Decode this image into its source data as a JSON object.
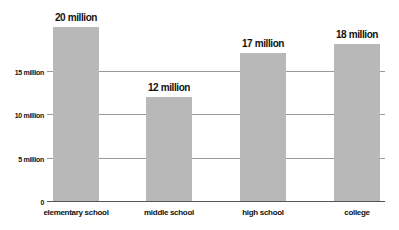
{
  "chart_data": {
    "type": "bar",
    "title": "",
    "xlabel": "",
    "ylabel": "",
    "categories": [
      "elementary school",
      "middle school",
      "high school",
      "college"
    ],
    "values": [
      20,
      12,
      17,
      18
    ],
    "unit": "million",
    "value_labels": [
      "20 million",
      "12 million",
      "17 million",
      "18 million"
    ],
    "ylim": [
      0,
      20
    ],
    "yticks": [
      0,
      5,
      10,
      15
    ],
    "ytick_labels": [
      "0",
      "5 million",
      "10 million",
      "15 million"
    ],
    "grid": true,
    "legend": null,
    "colors": {
      "bar": "#b8b8b8",
      "grid": "#9a9a9a",
      "text": "#111111"
    }
  }
}
